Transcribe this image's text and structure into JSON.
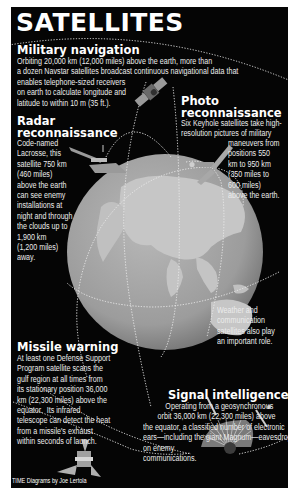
{
  "title": "SATELLITES",
  "sections": {
    "military_navigation": {
      "heading": "Military navigation",
      "body_lines": [
        "Orbiting 20,000 km (12,000 miles) above the earth, more than",
        "a dozen Navstar satellites broadcast continuous navigational data that",
        "enables telephone-sized receivers",
        "on earth to calculate longitude and",
        "latitude to within 10 m (35 ft.)."
      ]
    },
    "radar_reconnaissance": {
      "heading_lines": [
        "Radar",
        "reconnaissance"
      ],
      "body_lines": [
        "Code-named",
        "Lacrosse, this",
        "satellite 750 km",
        "(460 miles)",
        "above the earth",
        "can see enemy",
        "installations at",
        "night and through",
        "the clouds up to",
        "1,900 km",
        "(1,200 miles)",
        "away."
      ]
    },
    "photo_reconnaissance": {
      "heading_lines": [
        "Photo",
        "reconnaissance"
      ],
      "body_lines_top": [
        "Six Keyhole satellites take high-",
        "resolution pictures of military"
      ],
      "body_lines_side": [
        "maneuvers from",
        "positions 550",
        "km to 950 km",
        "(350 miles to",
        "600 miles)",
        "above the earth."
      ]
    },
    "weather_note": {
      "body_lines": [
        "Weather and",
        "communication",
        "satellites also play",
        "an important role."
      ]
    },
    "missile_warning": {
      "heading": "Missile warning",
      "body_lines": [
        "At least one Defense Support",
        "Program satellite scans the",
        "gulf region at all times from",
        "its stationary position 36,000",
        "km (22,300 miles) above the",
        "equator.  Its infrared",
        "telescope can detect the heat",
        "from a missile's exhaust",
        "within seconds of launch."
      ]
    },
    "signal_intelligence": {
      "heading": "Signal intelligence",
      "body_lines": [
        "Operating from a geosynchronous",
        "orbit 36,000 km (22,300 miles) above",
        "the equator, a classified number of electronic",
        "ears—including the giant Magnum—eavesdrop",
        "on enemy",
        "communications."
      ]
    }
  },
  "credit": "TIME Diagrams by Joe Lertola",
  "colors": {
    "background": "#050505",
    "text": "#ffffff",
    "earth": "#9a9a9a",
    "land": "#c4c4c4",
    "orbit": "#e8e8e8"
  },
  "icons": [
    "earth-globe-icon",
    "navstar-satellite-icon",
    "lacrosse-satellite-icon",
    "keyhole-satellite-icon",
    "dsp-satellite-icon",
    "magnum-satellite-icon"
  ]
}
